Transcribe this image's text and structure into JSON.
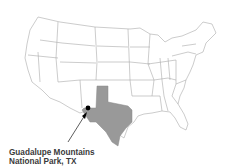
{
  "map": {
    "title": "United States locator map",
    "highlighted_state": "Texas",
    "highlight_color": "#999999",
    "state_fill": "#ffffff",
    "border_color": "#aaaaaa",
    "marker_color": "#000000"
  },
  "label": {
    "line1": "Guadalupe Mountains",
    "line2": "National Park, TX"
  }
}
